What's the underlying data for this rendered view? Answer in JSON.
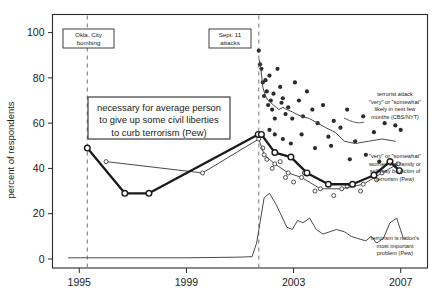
{
  "chart_data": {
    "type": "line",
    "title": "",
    "xlabel": "",
    "ylabel": "percent of respondents",
    "xlim": [
      1994.0,
      2008.0
    ],
    "ylim": [
      -4,
      108
    ],
    "grid": false,
    "legend_position": "inline-right-annotations",
    "xticks": [
      "1995",
      "1999",
      "2003",
      "2007"
    ],
    "xtick_values": [
      1995,
      1999,
      2003,
      2007
    ],
    "yticks": [
      "0",
      "20",
      "40",
      "60",
      "80",
      "100"
    ],
    "ytick_values": [
      0,
      20,
      40,
      60,
      80,
      100
    ],
    "event_markers": [
      {
        "label": "Okla. City\nbombing",
        "line1": "Okla. City",
        "line2": "bombing",
        "x": 1995.3
      },
      {
        "label": "Sept. 11\nattacks",
        "line1": "Sept. 11",
        "line2": "attacks",
        "x": 2001.7
      }
    ],
    "callout": {
      "line1": "necessary for average person",
      "line2": "to give up some civil liberties",
      "line3": "to curb terrorism (Pew)"
    },
    "series": [
      {
        "name": "terrorist attack \"very\" or \"somewhat\" likely in next few months (CBS/NYT)",
        "label_lines": [
          "terrorist attack",
          "\"very\" or \"somewhat\"",
          "likely in next few",
          "months (CBS/NYT)"
        ],
        "marker": "filled-circle",
        "line": "thin",
        "x": [
          2001.72,
          2001.78,
          2001.85,
          2001.95,
          2002.05,
          2002.15,
          2002.25,
          2002.35,
          2002.45,
          2002.6,
          2002.75,
          2002.95,
          2003.1,
          2003.3,
          2003.6,
          2003.9,
          2004.2,
          2004.55,
          2004.9,
          2005.3,
          2005.8,
          2006.3,
          2006.8
        ],
        "values": [
          88,
          84,
          76,
          72,
          70,
          69,
          68,
          67,
          66,
          67,
          66,
          65,
          64,
          63,
          62,
          60,
          58,
          56,
          52,
          51,
          52,
          53,
          52
        ],
        "scatter_x": [
          2001.7,
          2001.75,
          2001.8,
          2001.85,
          2001.9,
          2001.95,
          2002.0,
          2002.05,
          2002.1,
          2002.15,
          2002.2,
          2002.25,
          2002.3,
          2002.4,
          2002.5,
          2002.55,
          2002.6,
          2002.7,
          2002.8,
          2002.95,
          2003.05,
          2003.2,
          2003.35,
          2003.5,
          2003.7,
          2003.9,
          2004.1,
          2004.3,
          2004.5,
          2004.75,
          2005.0,
          2005.3,
          2005.6,
          2006.0,
          2006.4,
          2006.8,
          2007.0,
          2002.1,
          2002.3,
          2002.6,
          2002.9,
          2003.3,
          2003.8,
          2004.4,
          2005.1,
          2005.7,
          2006.2
        ],
        "scatter_y": [
          92,
          86,
          84,
          78,
          72,
          79,
          74,
          68,
          81,
          70,
          66,
          73,
          62,
          84,
          76,
          69,
          71,
          64,
          67,
          62,
          78,
          70,
          63,
          74,
          66,
          60,
          68,
          54,
          61,
          58,
          66,
          52,
          63,
          56,
          60,
          59,
          57,
          57,
          55,
          53,
          51,
          55,
          49,
          50,
          44,
          46,
          43
        ]
      },
      {
        "name": "necessary for average person to give up some civil liberties to curb terrorism (Pew)",
        "marker": "open-circle",
        "line": "thick",
        "x": [
          1995.3,
          1996.7,
          1997.6,
          2001.68,
          2001.8,
          2002.3,
          2002.9,
          2003.5,
          2004.3,
          2005.2,
          2006.0,
          2006.6,
          2006.95
        ],
        "values": [
          49,
          29,
          29,
          55,
          55,
          47,
          45,
          38,
          33,
          33,
          37,
          43,
          39
        ]
      },
      {
        "name": "\"very\" or \"somewhat\" worried that family or self may be victim of terrorism (Pew)",
        "label_lines": [
          "\"very\" or \"somewhat\"",
          "worried that family or",
          "self may be victim of",
          "terrorism (Pew)"
        ],
        "marker": "open-circle",
        "line": "thin",
        "x": [
          1996.0,
          1999.6,
          2001.7,
          2001.9,
          2002.3,
          2002.8,
          2003.3,
          2004.0,
          2004.8,
          2005.6,
          2006.3,
          2006.9
        ],
        "values": [
          43,
          38,
          53,
          46,
          42,
          38,
          36,
          31,
          31,
          33,
          38,
          42
        ],
        "extra_scatter_x": [
          2001.85,
          2002.0,
          2002.2,
          2002.5,
          2002.7,
          2003.0,
          2003.4,
          2003.8,
          2004.5,
          2005.0,
          2005.5,
          2006.1
        ],
        "extra_scatter_y": [
          49,
          44,
          40,
          43,
          36,
          34,
          38,
          30,
          28,
          32,
          30,
          35
        ]
      },
      {
        "name": "terrorism is nation's most important problem (Pew)",
        "label_lines": [
          "terrorism is nation's",
          "most important",
          "problem (Pew)"
        ],
        "marker": "none",
        "line": "thin",
        "x": [
          1994.6,
          1999.0,
          2001.0,
          2001.45,
          2001.62,
          2001.9,
          2002.1,
          2002.35,
          2002.55,
          2002.75,
          2002.95,
          2003.15,
          2003.35,
          2003.6,
          2003.85,
          2004.1,
          2004.35,
          2004.6,
          2004.9,
          2005.15,
          2005.4,
          2005.7,
          2005.9,
          2006.1,
          2006.35,
          2006.6,
          2006.85,
          2007.1
        ],
        "values": [
          0.5,
          0.5,
          0.8,
          1,
          7,
          27,
          29,
          24,
          19,
          14,
          13,
          17,
          16,
          18,
          13,
          11,
          12,
          13,
          12,
          10,
          9,
          8,
          10,
          7,
          9,
          16,
          18,
          9
        ]
      }
    ]
  },
  "axis": {
    "ylabel": "percent of respondents"
  },
  "colors": {
    "ink": "#1a1a1a",
    "frame": "#2b2b2b",
    "dashed": "#8a8a8a",
    "thin_line": "#4a4a4a"
  }
}
